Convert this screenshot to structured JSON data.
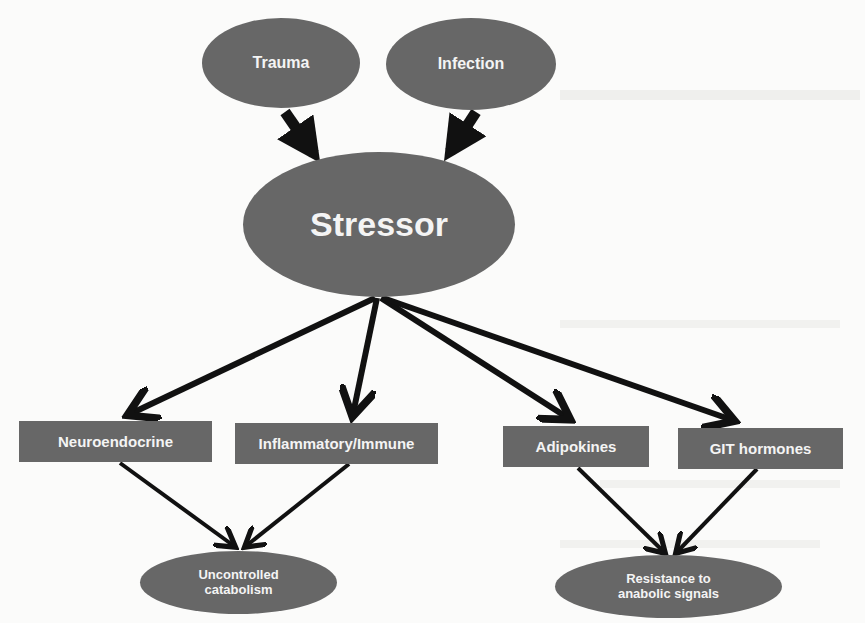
{
  "diagram": {
    "type": "flowchart",
    "fill_color": "#676767",
    "text_color": "#f4f4f4",
    "arrow_color": "#111111",
    "background_color": "#fbfbfa",
    "sources": [
      {
        "id": "trauma",
        "label": "Trauma"
      },
      {
        "id": "infection",
        "label": "Infection"
      }
    ],
    "center": {
      "id": "stressor",
      "label": "Stressor"
    },
    "mediators": [
      {
        "id": "neuroendocrine",
        "label": "Neuroendocrine"
      },
      {
        "id": "inflammatory",
        "label": "Inflammatory/Immune"
      },
      {
        "id": "adipokines",
        "label": "Adipokines"
      },
      {
        "id": "git",
        "label": "GIT hormones"
      }
    ],
    "outcomes": [
      {
        "id": "catabolism",
        "line1": "Uncontrolled",
        "line2": "catabolism"
      },
      {
        "id": "resistance",
        "line1": "Resistance to",
        "line2": "anabolic signals"
      }
    ],
    "edges": [
      [
        "trauma",
        "stressor"
      ],
      [
        "infection",
        "stressor"
      ],
      [
        "stressor",
        "neuroendocrine"
      ],
      [
        "stressor",
        "inflammatory"
      ],
      [
        "stressor",
        "adipokines"
      ],
      [
        "stressor",
        "git"
      ],
      [
        "neuroendocrine",
        "catabolism"
      ],
      [
        "inflammatory",
        "catabolism"
      ],
      [
        "adipokines",
        "resistance"
      ],
      [
        "git",
        "resistance"
      ]
    ]
  }
}
